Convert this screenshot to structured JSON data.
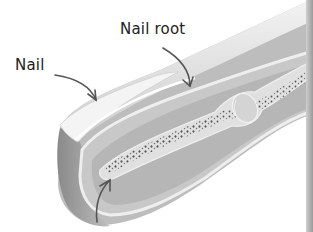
{
  "diagram": {
    "labels": [
      {
        "id": "nail",
        "text": "Nail"
      },
      {
        "id": "nail_root",
        "text": "Nail root"
      },
      {
        "id": "bone",
        "text": ""
      }
    ],
    "colors": {
      "background": "#ffffff",
      "skin_light": "#e6e6e6",
      "skin_mid": "#c4c4c4",
      "flesh": "#b0b0b0",
      "bone": "#dcdcdc",
      "marrow_dots": "#555555",
      "arrow": "#555555",
      "text": "#222222"
    }
  }
}
